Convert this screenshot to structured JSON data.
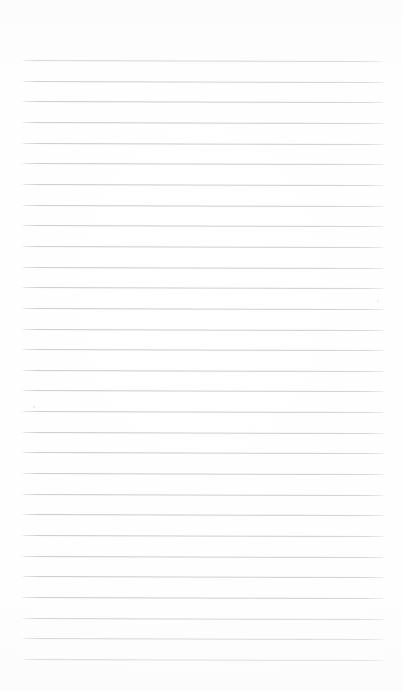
{
  "document": {
    "kind": "scanned-ruled-notepad-page",
    "title": "",
    "content_text": "",
    "is_blank": true,
    "page_width_px": 402,
    "page_height_px": 691,
    "background_color": "#fdfdfd",
    "paper_tone_color": "#fefefe"
  },
  "ruling": {
    "line_color": "#d0d0d7",
    "line_color_light": "#dadade",
    "line_thickness_px": 1,
    "line_count": 30,
    "first_line_y_px": 60,
    "last_line_y_px": 659,
    "line_spacing_px": 20.65,
    "line_left_x_px": 21,
    "line_right_x_px": 383,
    "line_length_px": 362,
    "skew_degrees": 0.16,
    "description": "Faint grey horizontal rules, evenly spaced, slightly skewed downward toward the right from scanning"
  },
  "margins": {
    "top_margin_px": 60,
    "bottom_margin_px": 32,
    "left_margin_px": 21,
    "right_margin_px": 19
  },
  "lines": [
    {
      "index": 1,
      "y": 60.0
    },
    {
      "index": 2,
      "y": 80.7
    },
    {
      "index": 3,
      "y": 101.3
    },
    {
      "index": 4,
      "y": 122.0
    },
    {
      "index": 5,
      "y": 142.6
    },
    {
      "index": 6,
      "y": 163.3
    },
    {
      "index": 7,
      "y": 183.9
    },
    {
      "index": 8,
      "y": 204.6
    },
    {
      "index": 9,
      "y": 225.2
    },
    {
      "index": 10,
      "y": 245.9
    },
    {
      "index": 11,
      "y": 266.5
    },
    {
      "index": 12,
      "y": 287.2
    },
    {
      "index": 13,
      "y": 307.8
    },
    {
      "index": 14,
      "y": 328.5
    },
    {
      "index": 15,
      "y": 349.1
    },
    {
      "index": 16,
      "y": 369.8
    },
    {
      "index": 17,
      "y": 390.4
    },
    {
      "index": 18,
      "y": 411.1
    },
    {
      "index": 19,
      "y": 431.7
    },
    {
      "index": 20,
      "y": 452.4
    },
    {
      "index": 21,
      "y": 473.0
    },
    {
      "index": 22,
      "y": 493.7
    },
    {
      "index": 23,
      "y": 514.3
    },
    {
      "index": 24,
      "y": 535.0
    },
    {
      "index": 25,
      "y": 555.6
    },
    {
      "index": 26,
      "y": 576.3
    },
    {
      "index": 27,
      "y": 596.9
    },
    {
      "index": 28,
      "y": 617.6
    },
    {
      "index": 29,
      "y": 638.2
    },
    {
      "index": 30,
      "y": 658.9
    }
  ],
  "artifacts": [
    {
      "name": "scan-speck",
      "x": 33,
      "y": 406,
      "size": 2.0,
      "opacity": 0.22
    },
    {
      "name": "scan-speck",
      "x": 377,
      "y": 300,
      "size": 1.6,
      "opacity": 0.16
    },
    {
      "name": "scan-speck",
      "x": 186,
      "y": 262,
      "size": 1.4,
      "opacity": 0.12
    },
    {
      "name": "scan-speck",
      "x": 145,
      "y": 352,
      "size": 1.4,
      "opacity": 0.12
    },
    {
      "name": "scan-speck",
      "x": 246,
      "y": 598,
      "size": 1.3,
      "opacity": 0.1
    },
    {
      "name": "scan-speck",
      "x": 311,
      "y": 18,
      "size": 1.5,
      "opacity": 0.1
    }
  ]
}
